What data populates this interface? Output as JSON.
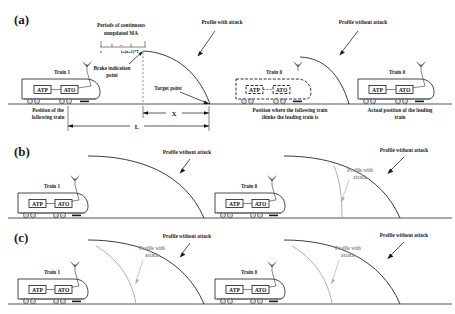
{
  "figure": {
    "panels": [
      "(a)",
      "(b)",
      "(c)"
    ]
  },
  "panel_a": {
    "label": "(a)",
    "timeline": {
      "caption_line1": "Periods of continuous",
      "caption_line2": "unupdated MA",
      "tick_start": "t",
      "tick_end": "t+(n+1)*T",
      "tick_mid": "..."
    },
    "annotations": {
      "brake_point_line1": "Brake indication",
      "brake_point_line2": "point",
      "target_point": "Target point",
      "profile_with_attack": "Profile with attack",
      "profile_without_attack": "Profile without attack"
    },
    "trains": [
      {
        "name": "Train 1",
        "atp": "ATP",
        "ato": "ATO",
        "style": "solid",
        "caption_line1": "Position of the",
        "caption_line2": "following train"
      },
      {
        "name": "Train 0",
        "atp": "ATP",
        "ato": "ATO",
        "style": "dashed",
        "caption_line1": "Position where the following train",
        "caption_line2": "thinks the leading train is"
      },
      {
        "name": "Train 0",
        "atp": "ATP",
        "ato": "ATO",
        "style": "solid",
        "caption_line1": "Actual position of the leading",
        "caption_line2": "train"
      }
    ],
    "dimensions": {
      "x": "X",
      "l": "L"
    }
  },
  "panel_b": {
    "label": "(b)",
    "annotations": {
      "profile_without_attack_left": "Profile without attack",
      "profile_without_attack_right": "Profile without attack",
      "profile_with_attack_line1": "Profile with",
      "profile_with_attack_line2": "attack"
    },
    "trains": [
      {
        "name": "Train 1",
        "atp": "ATP",
        "ato": "ATO",
        "style": "solid"
      },
      {
        "name": "Train 0",
        "atp": "ATP",
        "ato": "ATO",
        "style": "solid"
      }
    ]
  },
  "panel_c": {
    "label": "(c)",
    "annotations": {
      "profile_without_attack_left": "Profile without attack",
      "profile_without_attack_right": "Profile without attack",
      "profile_with_attack_left_line1": "Profile with",
      "profile_with_attack_left_line2": "attack",
      "profile_with_attack_right_line1": "Profile with",
      "profile_with_attack_right_line2": "attack"
    },
    "trains": [
      {
        "name": "Train 1",
        "atp": "ATP",
        "ato": "ATO",
        "style": "solid"
      },
      {
        "name": "Train 0",
        "atp": "ATP",
        "ato": "ATO",
        "style": "solid"
      }
    ]
  },
  "colors": {
    "ink": "#1a1a1a",
    "grey_curve": "#9a9a9a",
    "rail": "#555555",
    "wheel": "#d7d7d7"
  }
}
